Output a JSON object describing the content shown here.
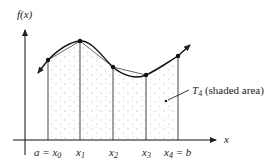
{
  "axes": {
    "y_label": "f(x)",
    "x_label": "x"
  },
  "ticks": [
    {
      "label": "a = x",
      "sub": "0",
      "x": 48,
      "y_pt": 60
    },
    {
      "label": "x",
      "sub": "1",
      "x": 80,
      "y_pt": 41
    },
    {
      "label": "x",
      "sub": "2",
      "x": 113,
      "y_pt": 67
    },
    {
      "label": "x",
      "sub": "3",
      "x": 146,
      "y_pt": 75
    },
    {
      "label": "x",
      "sub": "4",
      "suffix": " = b",
      "x": 178,
      "y_pt": 56
    }
  ],
  "annotation": {
    "symbol": "T",
    "sub": "4",
    "text": " (shaded area)"
  },
  "colors": {
    "ink": "#222222",
    "shade": "#b8b8b8",
    "chord": "#555555"
  }
}
